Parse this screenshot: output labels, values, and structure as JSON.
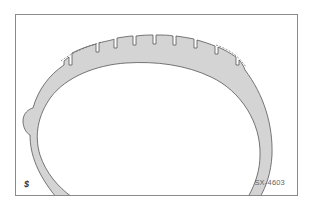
{
  "figure": {
    "id_label": "SX-4603",
    "logo_glyph": "$",
    "colors": {
      "tire_fill": "#d4d4d4",
      "outline": "#555555",
      "frame": "#8a8a8a",
      "background": "#ffffff"
    },
    "tread_groove_count": 9,
    "wear_indicator": "dashed original tread outline"
  }
}
